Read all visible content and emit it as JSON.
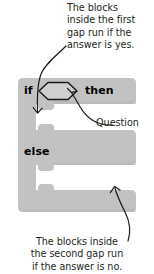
{
  "diagram": {
    "block": {
      "type": "if-then-else",
      "fill_color": "#c2c2c2",
      "labels": {
        "if": "if",
        "then": "then",
        "else": "else"
      },
      "boolean_slot": {
        "shape": "hexagon",
        "empty": true,
        "stroke_color": "#1a1a1a"
      },
      "gaps": [
        {
          "name": "first-gap",
          "branch": "yes"
        },
        {
          "name": "second-gap",
          "branch": "no"
        }
      ]
    },
    "annotations": {
      "top_caption": "The blocks\ninside the first\ngap run if the\nanswer is yes.",
      "bottom_caption": "The blocks inside\nthe second gap run\nif the answer is no.",
      "question_label": "Question"
    },
    "colors": {
      "background": "#ffffff",
      "block": "#c2c2c2",
      "gap": "#ffffff",
      "text": "#231f20",
      "arrow": "#1a1a1a"
    }
  }
}
